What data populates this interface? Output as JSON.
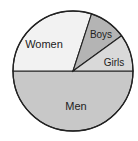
{
  "chart_data": {
    "type": "pie",
    "title": "",
    "categories": [
      "Men",
      "Women",
      "Boys",
      "Girls"
    ],
    "values": [
      50,
      30,
      10,
      10
    ],
    "colors": [
      "#c8c8c8",
      "#f2f2f2",
      "#b4b4b4",
      "#d9d9d9"
    ],
    "labels_inside": true,
    "legend": "none"
  },
  "labels": {
    "men": "Men",
    "women": "Women",
    "boys": "Boys",
    "girls": "Girls"
  }
}
